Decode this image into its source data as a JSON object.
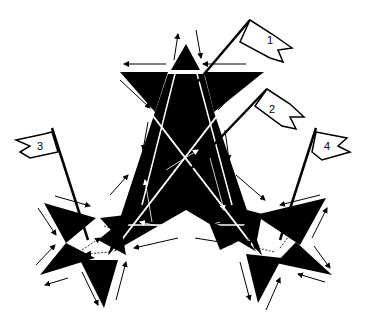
{
  "diagram": {
    "colors": {
      "fill": "#000000",
      "background": "#ffffff",
      "stroke": "#000000"
    },
    "flags": [
      {
        "id": "1",
        "label": "1",
        "flag_x": 255,
        "flag_y": 28,
        "pole_from": [
          245,
          28
        ],
        "pole_to": [
          182,
          100
        ]
      },
      {
        "id": "2",
        "label": "2",
        "flag_x": 270,
        "flag_y": 98,
        "pole_from": [
          254,
          98
        ],
        "pole_to": [
          180,
          178
        ]
      },
      {
        "id": "3",
        "label": "3",
        "flag_x": 38,
        "flag_y": 147,
        "pole_from": [
          52,
          130
        ],
        "pole_to": [
          90,
          240
        ]
      },
      {
        "id": "4",
        "label": "4",
        "flag_x": 318,
        "flag_y": 147,
        "pole_from": [
          304,
          130
        ],
        "pole_to": [
          280,
          240
        ]
      }
    ],
    "stars": [
      {
        "name": "central-star",
        "cx": 185,
        "cy": 150
      },
      {
        "name": "left-star",
        "cx": 90,
        "cy": 240
      },
      {
        "name": "right-star",
        "cx": 283,
        "cy": 237
      }
    ]
  }
}
